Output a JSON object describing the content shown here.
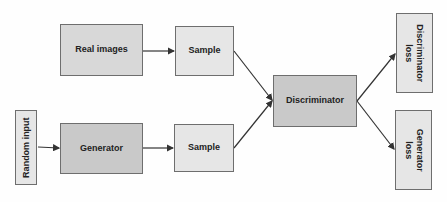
{
  "diagram": {
    "type": "flowchart",
    "title": "",
    "nodes": [
      {
        "id": "random_input",
        "label": "Random input"
      },
      {
        "id": "real_images",
        "label": "Real images"
      },
      {
        "id": "generator",
        "label": "Generator"
      },
      {
        "id": "sample_real",
        "label": "Sample"
      },
      {
        "id": "sample_fake",
        "label": "Sample"
      },
      {
        "id": "discriminator",
        "label": "Discriminator"
      },
      {
        "id": "discriminator_loss",
        "label": "Discriminator loss"
      },
      {
        "id": "generator_loss",
        "label": "Generator loss"
      }
    ],
    "edges": [
      {
        "from": "real_images",
        "to": "sample_real"
      },
      {
        "from": "random_input",
        "to": "generator"
      },
      {
        "from": "generator",
        "to": "sample_fake"
      },
      {
        "from": "sample_real",
        "to": "discriminator"
      },
      {
        "from": "sample_fake",
        "to": "discriminator"
      },
      {
        "from": "discriminator",
        "to": "discriminator_loss"
      },
      {
        "from": "discriminator",
        "to": "generator_loss"
      }
    ]
  },
  "colors": {
    "border": "#6e6e6e",
    "arrow": "#333333",
    "box_light": "#e6e6e6",
    "box_mid": "#d8d8d8",
    "box_dark": "#c9c9c9"
  }
}
